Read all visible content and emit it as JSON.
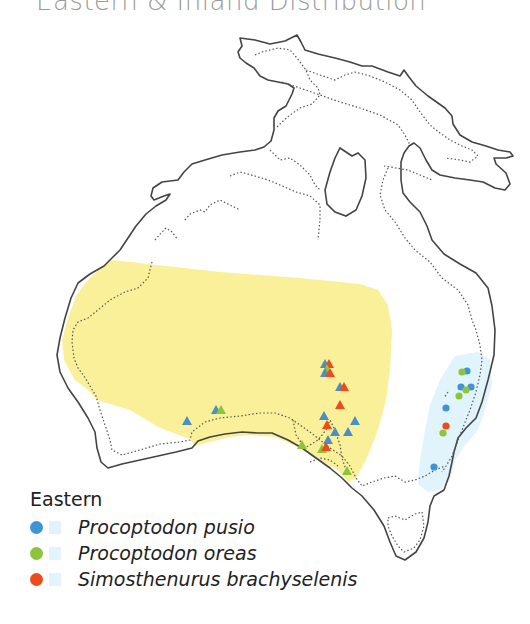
{
  "title": "Eastern & Inland Distribution",
  "colors": {
    "inland_region": "#f8ee8e",
    "eastern_region": "#e1f4fb",
    "pusio": "#3f94d6",
    "oreas": "#8cc43a",
    "brachyselenis": "#ee4a1c",
    "coastline": "#444444",
    "shoreline_dotted": "#555555"
  },
  "legend": {
    "heading": "Eastern",
    "items": [
      {
        "label": "Procoptodon pusio",
        "color": "#3f94d6",
        "swatch": "#e1f4fb"
      },
      {
        "label": "Procoptodon oreas",
        "color": "#8cc43a",
        "swatch": "#e1f4fb"
      },
      {
        "label": "Simosthenurus brachyselenis",
        "color": "#ee4a1c",
        "swatch": "#e1f4fb"
      }
    ]
  },
  "markers": {
    "eastern_circles": [
      {
        "x": 467,
        "y": 371,
        "species": "pusio"
      },
      {
        "x": 462,
        "y": 372,
        "species": "oreas"
      },
      {
        "x": 461,
        "y": 387,
        "species": "pusio"
      },
      {
        "x": 471,
        "y": 387,
        "species": "pusio"
      },
      {
        "x": 466,
        "y": 390,
        "species": "oreas"
      },
      {
        "x": 459,
        "y": 396,
        "species": "oreas"
      },
      {
        "x": 446,
        "y": 408,
        "species": "pusio"
      },
      {
        "x": 446,
        "y": 426,
        "species": "brachyselenis"
      },
      {
        "x": 443,
        "y": 433,
        "species": "oreas"
      },
      {
        "x": 434,
        "y": 467,
        "species": "pusio"
      }
    ],
    "inland_triangles": [
      {
        "x": 325,
        "y": 364,
        "species": "pusio"
      },
      {
        "x": 328,
        "y": 364,
        "species": "brachyselenis"
      },
      {
        "x": 327,
        "y": 369,
        "species": "oreas"
      },
      {
        "x": 325,
        "y": 373,
        "species": "pusio"
      },
      {
        "x": 329,
        "y": 373,
        "species": "brachyselenis"
      },
      {
        "x": 340,
        "y": 387,
        "species": "pusio"
      },
      {
        "x": 344,
        "y": 388,
        "species": "brachyselenis"
      },
      {
        "x": 340,
        "y": 405,
        "species": "brachyselenis"
      },
      {
        "x": 324,
        "y": 416,
        "species": "pusio"
      },
      {
        "x": 355,
        "y": 421,
        "species": "pusio"
      },
      {
        "x": 327,
        "y": 425,
        "species": "brachyselenis"
      },
      {
        "x": 335,
        "y": 432,
        "species": "pusio"
      },
      {
        "x": 348,
        "y": 432,
        "species": "pusio"
      },
      {
        "x": 328,
        "y": 440,
        "species": "pusio"
      },
      {
        "x": 302,
        "y": 445,
        "species": "oreas"
      },
      {
        "x": 324,
        "y": 449,
        "species": "oreas"
      },
      {
        "x": 326,
        "y": 447,
        "species": "brachyselenis"
      },
      {
        "x": 347,
        "y": 471,
        "species": "oreas"
      },
      {
        "x": 216,
        "y": 410,
        "species": "pusio"
      },
      {
        "x": 221,
        "y": 410,
        "species": "oreas"
      },
      {
        "x": 187,
        "y": 421,
        "species": "pusio"
      }
    ]
  }
}
